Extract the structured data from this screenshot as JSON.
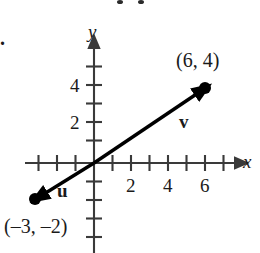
{
  "figure": {
    "type": "vector-diagram",
    "problem_number": ".",
    "axes": {
      "x_label": "x",
      "y_label": "y",
      "x_ticks": [
        -3,
        -2,
        -1,
        1,
        2,
        3,
        4,
        5,
        6,
        7
      ],
      "y_ticks": [
        -4,
        -3,
        -2,
        -1,
        1,
        2,
        3,
        4,
        5
      ],
      "x_tick_labels": [
        {
          "value": 2,
          "text": "2"
        },
        {
          "value": 4,
          "text": "4"
        },
        {
          "value": 6,
          "text": "6"
        }
      ],
      "y_tick_labels": [
        {
          "value": 2,
          "text": "2"
        },
        {
          "value": 4,
          "text": "4"
        }
      ],
      "x_range": [
        -3.8,
        7.8
      ],
      "y_range": [
        -5.0,
        5.4
      ],
      "origin_label": "",
      "grid": false
    },
    "vectors": [
      {
        "name": "v",
        "label": "v",
        "label_position": {
          "x": 4.9,
          "y": 2.2
        },
        "start": {
          "x": 0,
          "y": 0
        },
        "end": {
          "x": 6,
          "y": 4
        },
        "arrowhead": true,
        "endpoint_dot": true,
        "endpoint_label": "(6, 4)",
        "endpoint_label_position": {
          "x": 5.4,
          "y": 5.0
        },
        "color": "#000000"
      },
      {
        "name": "u",
        "label": "u",
        "label_position": {
          "x": -1.7,
          "y": -1.45
        },
        "start": {
          "x": 0,
          "y": 0
        },
        "end": {
          "x": -3,
          "y": -2
        },
        "arrowhead": true,
        "endpoint_dot": true,
        "endpoint_label": "(–3, –2)",
        "endpoint_label_position": {
          "x": -3.6,
          "y": -3.25
        },
        "color": "#000000"
      }
    ],
    "colors": {
      "ink": "#000000",
      "axis": "#3a3a3a",
      "background": "#ffffff"
    }
  }
}
